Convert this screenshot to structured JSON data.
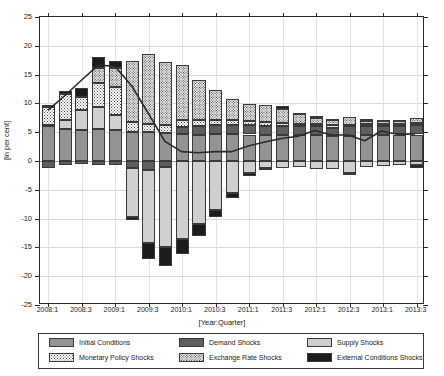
{
  "chart_data": {
    "type": "bar",
    "stacked": true,
    "title": "",
    "xlabel": "[Year:Quarter]",
    "ylabel": "[in per cent]",
    "ylim": [
      -25,
      25
    ],
    "yticks": [
      -25,
      -20,
      -15,
      -10,
      -5,
      0,
      5,
      10,
      15,
      20,
      25
    ],
    "grid": true,
    "legend_position": "below",
    "x": [
      "2008:1",
      "2008:2",
      "2008:3",
      "2008:4",
      "2009:1",
      "2009:2",
      "2009:3",
      "2009:4",
      "2010:1",
      "2010:2",
      "2010:3",
      "2010:4",
      "2011:1",
      "2011:2",
      "2011:3",
      "2011:4",
      "2012:1",
      "2012:2",
      "2012:3",
      "2012:4",
      "2013:1",
      "2013:2",
      "2013:3"
    ],
    "xtick_labels": [
      "2008:1",
      "2008:3",
      "2009:1",
      "2009:3",
      "2010:1",
      "2010:3",
      "2011:1",
      "2011:3",
      "2012:1",
      "2012:3",
      "2013:1",
      "2013:3"
    ],
    "xtick_indices": [
      0,
      2,
      4,
      6,
      8,
      10,
      12,
      14,
      16,
      18,
      20,
      22
    ],
    "series": [
      {
        "name": "Initial Conditions",
        "key": "initial",
        "color": "#939393",
        "pattern": "solid",
        "values": [
          6.0,
          5.6,
          5.4,
          5.5,
          5.4,
          5.1,
          5.1,
          4.9,
          4.7,
          4.6,
          4.7,
          4.7,
          4.6,
          4.5,
          4.5,
          4.6,
          4.6,
          4.4,
          4.4,
          4.5,
          4.6,
          4.6,
          4.6
        ]
      },
      {
        "name": "Demand Shocks",
        "key": "demand",
        "color": "#5e5e5e",
        "pattern": "solid",
        "values": [
          -1.2,
          -0.7,
          -0.6,
          -0.7,
          -0.7,
          -1.3,
          -1.5,
          -1.0,
          1.2,
          1.4,
          1.5,
          1.6,
          1.6,
          1.6,
          1.5,
          1.4,
          1.4,
          1.4,
          1.6,
          1.5,
          1.4,
          1.5,
          1.6
        ]
      },
      {
        "name": "Supply Shocks",
        "key": "supply",
        "color": "#cfcfcf",
        "pattern": "solid",
        "values": [
          0.3,
          1.6,
          3.5,
          3.8,
          2.6,
          -8.4,
          -12.8,
          -14.0,
          -13.6,
          -10.9,
          -8.5,
          -5.5,
          -2.0,
          -1.2,
          -1.3,
          -1.0,
          -1.4,
          -1.4,
          -2.1,
          -1.1,
          -0.8,
          -0.7,
          -0.7
        ]
      },
      {
        "name": "Monetary Policy Shocks",
        "key": "monetary",
        "color": "#ffffff",
        "pattern": "dotted",
        "values": [
          3.0,
          4.5,
          2.2,
          4.3,
          4.8,
          1.6,
          1.4,
          1.3,
          1.3,
          1.1,
          1.0,
          0.8,
          0.7,
          0.6,
          0.6,
          0.5,
          0.4,
          0.4,
          0.3,
          0.4,
          0.4,
          0.4,
          0.4
        ]
      },
      {
        "name": "Exchange Rate Shocks",
        "key": "exchange",
        "color": "#e4e4e4",
        "pattern": "fine-dotted",
        "values": [
          0.0,
          0.0,
          0.0,
          2.6,
          3.3,
          10.7,
          12.0,
          11.0,
          9.5,
          6.9,
          5.2,
          3.7,
          3.0,
          3.0,
          2.4,
          1.6,
          1.1,
          0.9,
          1.3,
          0.6,
          0.5,
          0.5,
          0.8
        ]
      },
      {
        "name": "External Conditions Shocks",
        "key": "external",
        "color": "#1c1c1c",
        "pattern": "solid",
        "values": [
          0.5,
          0.4,
          1.6,
          1.8,
          1.2,
          -0.6,
          -2.7,
          -3.2,
          -2.5,
          -2.1,
          -1.3,
          -1.0,
          -0.6,
          -0.4,
          0.5,
          0.3,
          0.3,
          0.2,
          -0.4,
          0.3,
          0.2,
          0.2,
          -0.5
        ]
      }
    ],
    "line_series": {
      "name": "Actual",
      "color": "#2b2b2b",
      "values": [
        8.8,
        11.3,
        14.0,
        16.6,
        16.4,
        13.0,
        8.2,
        3.3,
        1.5,
        1.3,
        1.5,
        1.5,
        2.5,
        3.2,
        3.8,
        4.2,
        5.2,
        4.4,
        4.4,
        3.4,
        5.1,
        4.5,
        4.6
      ]
    }
  },
  "legend": {
    "items": [
      {
        "label": "Initial Conditions",
        "key": "initial"
      },
      {
        "label": "Demand Shocks",
        "key": "demand"
      },
      {
        "label": "Supply Shocks",
        "key": "supply"
      },
      {
        "label": "Monetary Policy Shocks",
        "key": "monetary"
      },
      {
        "label": "Exchange Rate Shocks",
        "key": "exchange"
      },
      {
        "label": "External Conditions Shocks",
        "key": "external"
      }
    ]
  }
}
